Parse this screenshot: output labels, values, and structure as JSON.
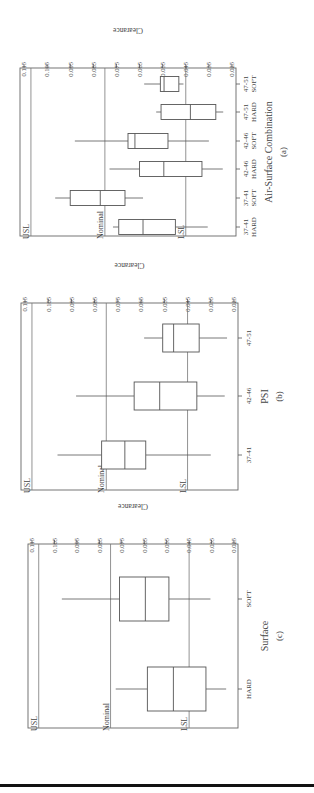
{
  "chart_data": [
    {
      "type": "boxplot",
      "panel_label": "(a)",
      "title": "",
      "xlabel": "Air-Surface Combination",
      "ylabel": "Clearance",
      "ylim": [
        0.025,
        0.115
      ],
      "yticks": [
        "0.115",
        "0.105",
        "0.095",
        "0.085",
        "0.075",
        "0.065",
        "0.055",
        "0.045",
        "0.035",
        "0.025"
      ],
      "reference_lines": [
        {
          "label": "USL",
          "value": 0.112
        },
        {
          "label": "Nominal",
          "value": 0.08
        },
        {
          "label": "LSL",
          "value": 0.045
        }
      ],
      "categories": [
        "37-41 HARD",
        "37-41 SOFT",
        "42-46 HARD",
        "42-46 SOFT",
        "47-51 HARD",
        "47-51 SOFT"
      ],
      "boxes": [
        {
          "category": "37-41 HARD",
          "whisker_high": 0.0765,
          "q3": 0.074,
          "median": 0.0635,
          "q1": 0.0495,
          "whisker_low": 0.0355
        },
        {
          "category": "37-41 SOFT",
          "whisker_high": 0.1015,
          "q3": 0.095,
          "median": 0.082,
          "q1": 0.0713,
          "whisker_low": 0.0635
        },
        {
          "category": "42-46 HARD",
          "whisker_high": 0.078,
          "q3": 0.065,
          "median": 0.0545,
          "q1": 0.038,
          "whisker_low": 0.029
        },
        {
          "category": "42-46 SOFT",
          "whisker_high": 0.093,
          "q3": 0.07,
          "median": 0.067,
          "q1": 0.0527,
          "whisker_low": 0.035
        },
        {
          "category": "47-51 HARD",
          "whisker_high": 0.0578,
          "q3": 0.0557,
          "median": 0.043,
          "q1": 0.032,
          "whisker_low": 0.0288
        },
        {
          "category": "47-51 SOFT",
          "whisker_high": 0.063,
          "q3": 0.056,
          "median": 0.0544,
          "q1": 0.048,
          "whisker_low": 0.046
        }
      ],
      "grid": false,
      "legend": "none"
    },
    {
      "type": "boxplot",
      "panel_label": "(b)",
      "xlabel": "PSI",
      "ylabel": "Clearance",
      "ylim": [
        0.025,
        0.115
      ],
      "yticks": [
        "0.115",
        "0.105",
        "0.095",
        "0.085",
        "0.075",
        "0.065",
        "0.055",
        "0.045",
        "0.035",
        "0.025"
      ],
      "reference_lines": [
        {
          "label": "USL",
          "value": 0.112
        },
        {
          "label": "Nominal",
          "value": 0.08
        },
        {
          "label": "LSL",
          "value": 0.045
        }
      ],
      "categories": [
        "37-41",
        "42-46",
        "47-51"
      ],
      "boxes": [
        {
          "category": "37-41",
          "whisker_high": 0.101,
          "q3": 0.082,
          "median": 0.072,
          "q1": 0.063,
          "whisker_low": 0.035
        },
        {
          "category": "42-46",
          "whisker_high": 0.093,
          "q3": 0.068,
          "median": 0.057,
          "q1": 0.041,
          "whisker_low": 0.029
        },
        {
          "category": "47-51",
          "whisker_high": 0.0637,
          "q3": 0.0557,
          "median": 0.051,
          "q1": 0.04,
          "whisker_low": 0.028
        }
      ],
      "grid": false,
      "legend": "none"
    },
    {
      "type": "boxplot",
      "panel_label": "(c)",
      "xlabel": "Surface",
      "ylabel": "Clearance",
      "ylim": [
        0.025,
        0.115
      ],
      "yticks": [
        "0.115",
        "0.105",
        "0.095",
        "0.085",
        "0.075",
        "0.065",
        "0.055",
        "0.045",
        "0.035",
        "0.025"
      ],
      "reference_lines": [
        {
          "label": "USL",
          "value": 0.112
        },
        {
          "label": "Nominal",
          "value": 0.08
        },
        {
          "label": "LSL",
          "value": 0.045
        }
      ],
      "categories": [
        "HARD",
        "SOFT"
      ],
      "boxes": [
        {
          "category": "HARD",
          "whisker_high": 0.0777,
          "q3": 0.0636,
          "median": 0.052,
          "q1": 0.0375,
          "whisker_low": 0.0285
        },
        {
          "category": "SOFT",
          "whisker_high": 0.1017,
          "q3": 0.076,
          "median": 0.0645,
          "q1": 0.054,
          "whisker_low": 0.0355
        }
      ],
      "grid": false,
      "legend": "none"
    }
  ],
  "labels": {
    "usl": "USL",
    "nominal": "Nominal",
    "lsl": "LSL",
    "clearance": "Clearance"
  },
  "panel_geometry": [
    {
      "id": "a",
      "frame_top": 68,
      "frame_bottom": 236,
      "x_hi": 24,
      "x_lo": 232,
      "frame_left": 20,
      "frame_right": 236,
      "cat_positions": [
        227,
        198,
        169,
        141,
        112,
        84
      ],
      "box_half": 7.5
    },
    {
      "id": "b",
      "frame_top": 303,
      "frame_bottom": 490,
      "x_hi": 25,
      "x_lo": 234,
      "frame_left": 21,
      "frame_right": 238,
      "cat_positions": [
        455,
        396,
        338
      ],
      "box_half": 14
    },
    {
      "id": "c",
      "frame_top": 544,
      "frame_bottom": 728,
      "x_hi": 32,
      "x_lo": 234,
      "frame_left": 28,
      "frame_right": 238,
      "cat_positions": [
        689,
        599
      ],
      "box_half": 22
    }
  ]
}
